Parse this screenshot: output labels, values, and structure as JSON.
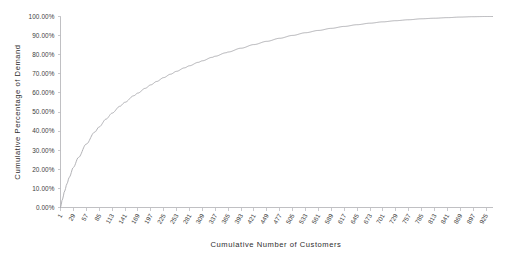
{
  "chart_data": {
    "type": "line",
    "title": "",
    "subtitle": "",
    "xlabel": "Cumulative Number of Customers",
    "ylabel": "Cumulative Percentage of Demand",
    "xlim": [
      1,
      939
    ],
    "ylim": [
      0,
      100
    ],
    "grid": false,
    "legend": null,
    "legend_position": "none",
    "y_tick_labels": [
      "0.00%",
      "10.00%",
      "20.00%",
      "30.00%",
      "40.00%",
      "50.00%",
      "60.00%",
      "70.00%",
      "80.00%",
      "90.00%",
      "100.00%"
    ],
    "y_tick_values": [
      0,
      10,
      20,
      30,
      40,
      50,
      60,
      70,
      80,
      90,
      100
    ],
    "x_tick_labels": [
      "1",
      "29",
      "57",
      "85",
      "113",
      "141",
      "169",
      "197",
      "225",
      "253",
      "281",
      "309",
      "337",
      "365",
      "393",
      "421",
      "449",
      "477",
      "505",
      "533",
      "561",
      "589",
      "617",
      "645",
      "673",
      "701",
      "729",
      "757",
      "785",
      "813",
      "841",
      "869",
      "897",
      "925"
    ],
    "x_tick_values": [
      1,
      29,
      57,
      85,
      113,
      141,
      169,
      197,
      225,
      253,
      281,
      309,
      337,
      365,
      393,
      421,
      449,
      477,
      505,
      533,
      561,
      589,
      617,
      645,
      673,
      701,
      729,
      757,
      785,
      813,
      841,
      869,
      897,
      925
    ],
    "series": [
      {
        "name": "Cumulative Percentage of Demand",
        "color": "#a9a9ae",
        "x": [
          1,
          5,
          10,
          15,
          20,
          29,
          40,
          57,
          75,
          85,
          100,
          113,
          130,
          141,
          160,
          169,
          185,
          197,
          210,
          225,
          240,
          253,
          270,
          281,
          300,
          309,
          330,
          337,
          360,
          365,
          393,
          421,
          449,
          477,
          505,
          533,
          561,
          589,
          617,
          645,
          673,
          701,
          729,
          757,
          785,
          813,
          841,
          869,
          897,
          925,
          939
        ],
        "y": [
          0.0,
          4.2,
          8.6,
          12.4,
          15.8,
          21.0,
          26.2,
          33.2,
          39.4,
          42.2,
          46.3,
          49.4,
          53.0,
          55.1,
          58.5,
          59.9,
          62.4,
          64.2,
          66.0,
          68.0,
          69.8,
          71.3,
          73.1,
          74.2,
          76.0,
          76.8,
          78.6,
          79.2,
          81.0,
          81.4,
          83.4,
          85.3,
          87.0,
          88.6,
          90.1,
          91.5,
          92.7,
          93.8,
          94.8,
          95.7,
          96.5,
          97.2,
          97.8,
          98.3,
          98.8,
          99.1,
          99.4,
          99.7,
          99.9,
          100.0,
          100.0
        ]
      }
    ]
  },
  "axes": {
    "x_axis_title": "Cumulative Number of Customers",
    "y_axis_title": "Cumulative Percentage of Demand"
  }
}
